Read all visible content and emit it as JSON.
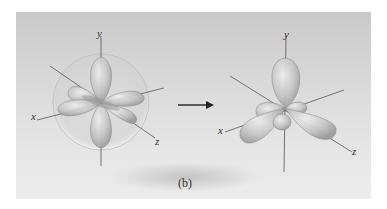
{
  "figure": {
    "caption": "(b)",
    "left_diagram": {
      "description": "d orbitals in sphere",
      "axis_labels": {
        "x": "x",
        "y": "y",
        "z": "z"
      }
    },
    "right_diagram": {
      "description": "hybrid orbitals",
      "axis_labels": {
        "x": "x",
        "y": "y",
        "z": "z"
      }
    },
    "arrow": "right-arrow"
  }
}
